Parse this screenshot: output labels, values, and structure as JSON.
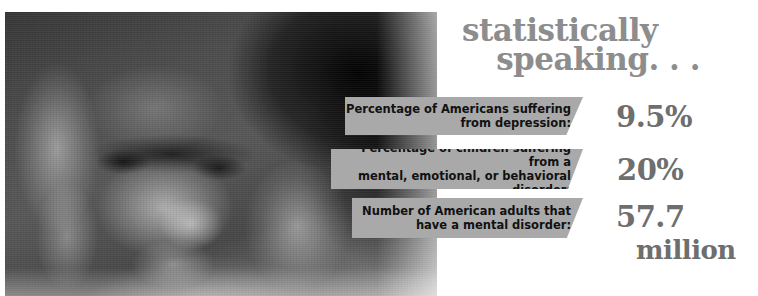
{
  "poster": {
    "title_line1": "statistically",
    "title_line2": "speaking. . .",
    "photo_alt": "grayscale-photo-person-head-in-hands-looking-down"
  },
  "colors": {
    "band_gray": "#a9a9a9",
    "title_gray": "#8d8d8d",
    "value_gray": "#6e6e6e",
    "label_black": "#111111",
    "background": "#ffffff"
  },
  "stats": [
    {
      "label_line1": "Percentage of Americans suffering",
      "label_line2": "from depression:",
      "value": "9.5%",
      "unit": ""
    },
    {
      "label_line1": "Percentage of children suffering from a",
      "label_line2": "mental, emotional, or behavioral disorder:",
      "value": "20%",
      "unit": ""
    },
    {
      "label_line1": "Number of American adults that",
      "label_line2": "have a mental disorder:",
      "value": "57.7",
      "unit": "million"
    }
  ]
}
